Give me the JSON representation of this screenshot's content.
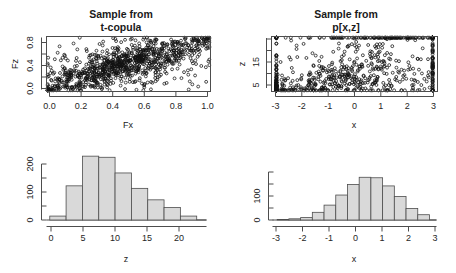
{
  "figure": {
    "background": "#ffffff",
    "panel_count": 4,
    "point_color": "#111111",
    "bar_fill": "#d9d9d9",
    "bar_stroke": "#4d4d4d"
  },
  "chart_data": [
    {
      "id": "scatter-copula",
      "type": "scatter",
      "title": "Sample from\nt-copula",
      "title_line1": "Sample from",
      "title_line2": "t-copula",
      "xlabel": "Fx",
      "ylabel": "Fz",
      "xlim": [
        0,
        1
      ],
      "ylim": [
        0,
        1
      ],
      "xticks": [
        0.0,
        0.2,
        0.4,
        0.6,
        0.8,
        1.0
      ],
      "xticklabels": [
        "0.0",
        "0.2",
        "0.4",
        "0.6",
        "0.8",
        "1.0"
      ],
      "yticks": [
        0.0,
        0.4,
        0.8
      ],
      "yticklabels": [
        "0.0",
        "0.4",
        "0.8"
      ],
      "grid": false,
      "legend": null,
      "marker": "open-circle",
      "n_points": 1000,
      "description": "t-copula sample: uniform marginals with strong tail dependence concentrating mass along the lower-left and upper-right corners",
      "seed": 7,
      "copula_rho": 0.62,
      "copula_df": 3
    },
    {
      "id": "scatter-joint",
      "type": "scatter",
      "title": "Sample from\np[x,z]",
      "title_line1": "Sample from",
      "title_line2": "p[x,z]",
      "xlabel": "x",
      "ylabel": "z",
      "xlim": [
        -3.6,
        3.2
      ],
      "ylim": [
        0,
        21
      ],
      "xticks": [
        -3,
        -2,
        -1,
        0,
        1,
        2,
        3
      ],
      "xticklabels": [
        "-3",
        "-2",
        "-1",
        "0",
        "1",
        "2",
        "3"
      ],
      "yticks": [
        5,
        15
      ],
      "yticklabels": [
        "5",
        "15"
      ],
      "grid": false,
      "legend": null,
      "marker": "open-circle",
      "n_points": 1000,
      "description": "Joint sample p[x,z]: x standard normal, z positively skewed (gamma-like), positively associated with x",
      "seed": 7
    },
    {
      "id": "hist-z",
      "type": "bar",
      "subtype": "histogram",
      "title": "",
      "xlabel": "z",
      "ylabel": "",
      "xlim": [
        -0.5,
        24
      ],
      "ylim": [
        0,
        240
      ],
      "xticks": [
        0,
        5,
        10,
        15,
        20
      ],
      "xticklabels": [
        "0",
        "5",
        "10",
        "15",
        "20"
      ],
      "yticks": [
        0,
        100,
        200
      ],
      "yticklabels": [
        "0",
        "100",
        "200"
      ],
      "grid": false,
      "legend": null,
      "bin_width": 2.5,
      "bin_edges": [
        0,
        2.5,
        5,
        7.5,
        10,
        12.5,
        15,
        17.5,
        20,
        22.5
      ],
      "categories": [
        "0-2.5",
        "2.5-5",
        "5-7.5",
        "7.5-10",
        "10-12.5",
        "12.5-15",
        "15-17.5",
        "17.5-20",
        "20-22.5"
      ],
      "values": [
        14,
        122,
        228,
        224,
        168,
        113,
        72,
        45,
        14,
        12,
        3
      ]
    },
    {
      "id": "hist-x",
      "type": "bar",
      "subtype": "histogram",
      "title": "",
      "xlabel": "x",
      "ylabel": "",
      "xlim": [
        -3.7,
        3.3
      ],
      "ylim": [
        0,
        200
      ],
      "xticks": [
        -3,
        -2,
        -1,
        0,
        1,
        2,
        3
      ],
      "xticklabels": [
        "-3",
        "-2",
        "-1",
        "0",
        "1",
        "2",
        "3"
      ],
      "yticks": [
        0,
        100
      ],
      "yticklabels": [
        "0",
        "100"
      ],
      "grid": false,
      "legend": null,
      "bin_width": 0.5,
      "bin_edges": [
        -3.5,
        -3,
        -2.5,
        -2,
        -1.5,
        -1,
        -0.5,
        0,
        0.5,
        1,
        1.5,
        2,
        2.5,
        3
      ],
      "categories": [
        "-3.5--3",
        "-3--2.5",
        "-2.5--2",
        "-2--1.5",
        "-1.5--1",
        "-1--0.5",
        "-0.5-0",
        "0-0.5",
        "0.5-1",
        "1-1.5",
        "1.5-2",
        "2-2.5",
        "2.5-3"
      ],
      "values": [
        2,
        5,
        10,
        32,
        62,
        104,
        148,
        178,
        176,
        142,
        98,
        48,
        22,
        6
      ]
    }
  ]
}
